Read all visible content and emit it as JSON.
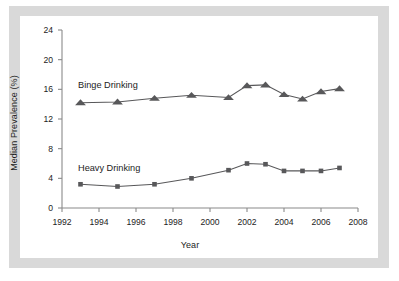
{
  "figure": {
    "frame_color": "#d9d9d9",
    "card_color": "#ffffff",
    "axis_color": "#8a8a8a",
    "series_color": "#58585a",
    "text_color": "#1d1d1d"
  },
  "chart_data": {
    "type": "line",
    "title": "",
    "subtitle": "",
    "xlabel": "Year",
    "ylabel": "Median Prevalence (%)",
    "xlim": [
      1992,
      2008
    ],
    "ylim": [
      0,
      24
    ],
    "xticks": [
      1992,
      1994,
      1996,
      1998,
      2000,
      2002,
      2004,
      2006,
      2008
    ],
    "yticks": [
      0,
      4,
      8,
      12,
      16,
      20,
      24
    ],
    "xtick_labels": [
      "1992",
      "1994",
      "1996",
      "1998",
      "2000",
      "2002",
      "2004",
      "2006",
      "2008"
    ],
    "ytick_labels": [
      "0",
      "4",
      "8",
      "12",
      "16",
      "20",
      "24"
    ],
    "grid": false,
    "legend_position": "inline-annotations",
    "x": [
      1993,
      1995,
      1997,
      1999,
      2001,
      2002,
      2003,
      2004,
      2005,
      2006,
      2007
    ],
    "series": [
      {
        "name": "Binge Drinking",
        "marker": "triangle",
        "color": "#58585a",
        "values": [
          14.2,
          14.3,
          14.8,
          15.2,
          14.9,
          16.5,
          16.6,
          15.3,
          14.7,
          15.7,
          16.1
        ]
      },
      {
        "name": "Heavy Drinking",
        "marker": "square",
        "color": "#58585a",
        "values": [
          3.2,
          2.9,
          3.2,
          4.0,
          5.1,
          6.0,
          5.9,
          5.0,
          5.0,
          5.0,
          5.4
        ]
      }
    ],
    "annotations": [
      {
        "text": "Binge Drinking",
        "x": 1993.2,
        "y": 18.6
      },
      {
        "text": "Heavy Drinking",
        "x": 1993.2,
        "y": 7.6
      }
    ]
  }
}
